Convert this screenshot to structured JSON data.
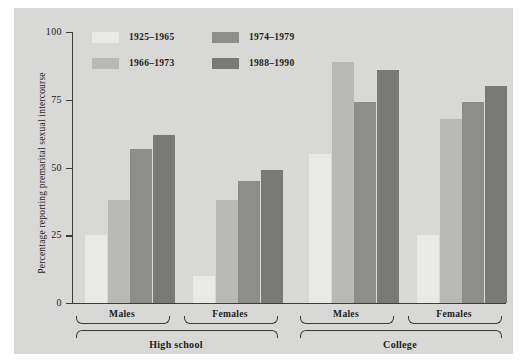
{
  "chart_data": {
    "type": "bar",
    "title": "",
    "xlabel": "",
    "ylabel": "Percentage reporting premarital sexual intercourse",
    "ylim": [
      0,
      100
    ],
    "yticks": [
      0,
      25,
      50,
      75,
      100
    ],
    "ytick_labels": [
      "0",
      "25",
      "50",
      "75",
      "100"
    ],
    "grid": false,
    "legend_position": "upper-left-inside",
    "categories": [
      "Males",
      "Females",
      "Males",
      "Females"
    ],
    "group_labels": [
      "High school",
      "College"
    ],
    "series": [
      {
        "name": "1925–1965",
        "color": "#e9e9e6",
        "values": [
          25,
          10,
          55,
          25
        ]
      },
      {
        "name": "1966–1973",
        "color": "#b9b9b7",
        "values": [
          38,
          38,
          89,
          68
        ]
      },
      {
        "name": "1974–1979",
        "color": "#8d8d8b",
        "values": [
          57,
          45,
          74,
          74
        ]
      },
      {
        "name": "1988–1990",
        "color": "#787877",
        "values": [
          62,
          49,
          86,
          80
        ]
      }
    ]
  },
  "legend": {
    "entries": [
      {
        "label": "1925–1965"
      },
      {
        "label": "1966–1973"
      },
      {
        "label": "1974–1979"
      },
      {
        "label": "1988–1990"
      }
    ]
  },
  "axes": {
    "y_title": "Percentage reporting premarital sexual intercourse",
    "y_labels": [
      "100",
      "75",
      "50",
      "25",
      "0"
    ]
  },
  "x_axis": {
    "subgroups": [
      "Males",
      "Females",
      "Males",
      "Females"
    ],
    "supergroups": [
      "High school",
      "College"
    ]
  },
  "colors": {
    "panel_background": "#d8d8d6",
    "page_background": "#ffffff",
    "axis": "#3b3b3b",
    "text": "#1c1c1c"
  }
}
